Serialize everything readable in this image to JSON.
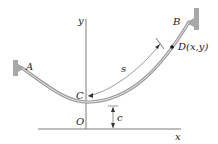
{
  "diagram": {
    "type": "catenary-cable",
    "labels": {
      "y_axis": "y",
      "x_axis": "x",
      "origin": "O",
      "lowest_point": "C",
      "support_left": "A",
      "support_right": "B",
      "point_d": "D(x,y)",
      "arc_length": "s",
      "sag_offset": "c"
    },
    "colors": {
      "cable": "#9a9a9a",
      "cable_highlight": "#e8e8e8",
      "axis": "#777777",
      "wall": "#a8a8a8",
      "text": "#222222",
      "point": "#111111"
    }
  }
}
